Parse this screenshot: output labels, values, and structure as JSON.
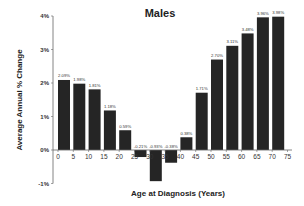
{
  "chart_data": {
    "type": "bar",
    "title": "Males",
    "xlabel": "Age at Diagnosis (Years)",
    "ylabel": "Average Annual % Change",
    "ylim": [
      -1,
      4
    ],
    "yticks": [
      "4%",
      "3%",
      "2%",
      "1%",
      "0%",
      "-1%"
    ],
    "ytick_values": [
      4,
      3,
      2,
      1,
      0,
      -1
    ],
    "xticks": [
      "0",
      "5",
      "10",
      "15",
      "20",
      "25",
      "30",
      "35",
      "40",
      "45",
      "50",
      "55",
      "60",
      "65",
      "70",
      "75"
    ],
    "categories": [
      "0",
      "5",
      "10",
      "15",
      "20",
      "25",
      "30",
      "35",
      "40",
      "45",
      "50",
      "55",
      "60",
      "65",
      "70"
    ],
    "values": [
      2.09,
      1.98,
      1.81,
      1.18,
      0.59,
      -0.21,
      -0.93,
      -0.38,
      0.38,
      1.71,
      2.7,
      3.11,
      3.48,
      3.96,
      3.98
    ],
    "data_labels": [
      "2.09%",
      "1.98%",
      "1.81%",
      "1.18%",
      "0.59%",
      "-0.21%",
      "-0.93%",
      "-0.38%",
      "0.38%",
      "1.71%",
      "2.70%",
      "3.11%",
      "3.48%",
      "3.96%",
      "3.98%"
    ],
    "bar_color": "#252525",
    "grid": false,
    "legend": null
  }
}
